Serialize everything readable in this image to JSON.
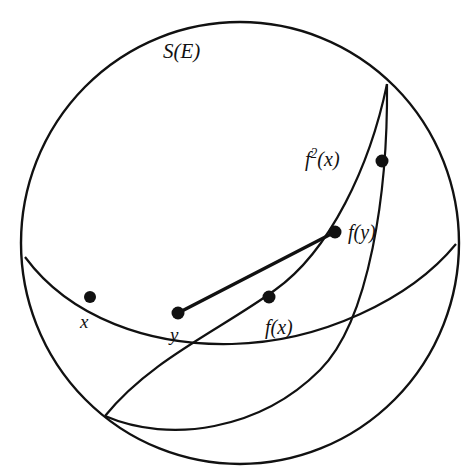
{
  "figure": {
    "background_color": "#ffffff",
    "stroke_color": "#111111",
    "width": 470,
    "height": 476
  },
  "labels": {
    "sphere": "S(E)",
    "f2x_base": "f",
    "f2x_exponent": "2",
    "f2x_arg": "(x)",
    "fy": "f(y)",
    "fx": "f(x)",
    "x": "x",
    "y": "y"
  },
  "geometry": {
    "sphere_outline": {
      "name": "sphere-outline",
      "center": [
        240,
        243
      ],
      "radius": 219
    },
    "equator_arc": {
      "name": "equator-great-circle",
      "start": [
        25,
        257
      ],
      "end": [
        456,
        244
      ],
      "lowest_point_y": 314
    },
    "tilted_arc": {
      "name": "tilted-great-circle",
      "start": [
        105,
        416
      ],
      "end": [
        387,
        84
      ]
    },
    "chord": {
      "name": "geodesic-chord-y-to-fy",
      "from": [
        178,
        313
      ],
      "to": [
        335,
        232
      ]
    }
  },
  "points": [
    {
      "id": "x",
      "label": "x",
      "cx": 90,
      "cy": 297,
      "r": 6
    },
    {
      "id": "y",
      "label": "y",
      "cx": 178,
      "cy": 313,
      "r": 6
    },
    {
      "id": "fx",
      "label": "f(x)",
      "cx": 269,
      "cy": 297,
      "r": 6
    },
    {
      "id": "fy",
      "label": "f(y)",
      "cx": 335,
      "cy": 232,
      "r": 6
    },
    {
      "id": "f2x",
      "label": "f2(x)",
      "cx": 382,
      "cy": 161,
      "r": 6
    }
  ]
}
